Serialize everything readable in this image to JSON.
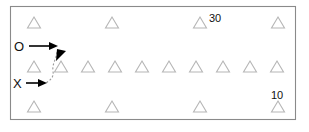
{
  "figure": {
    "background_color": "#ffffff",
    "frame": {
      "x": 10,
      "y": 6,
      "width": 286,
      "height": 114,
      "stroke_color": "#8a8a8a"
    },
    "marker": {
      "shape": "triangle-outline",
      "stroke_color": "#b6b6b6",
      "width": 13,
      "height": 11
    },
    "rows": [
      {
        "name": "top-row",
        "y": 28,
        "x_positions": [
          34,
          112,
          200,
          278
        ]
      },
      {
        "name": "middle-row",
        "y": 72,
        "x_positions": [
          34,
          61,
          88,
          115,
          142,
          169,
          196,
          223,
          250,
          277
        ]
      },
      {
        "name": "bottom-row",
        "y": 112,
        "x_positions": [
          34,
          112,
          200,
          278
        ]
      }
    ],
    "value_labels": [
      {
        "name": "label-30",
        "text": "30",
        "x": 205,
        "y": 21
      },
      {
        "name": "label-10",
        "text": "10",
        "x": 272,
        "y": 98
      }
    ],
    "annotations": [
      {
        "name": "o-annotation",
        "label": "O",
        "label_x": 14,
        "label_y": 51,
        "arrow_start_x": 29,
        "arrow_start_y": 46,
        "arrow_end_x": 57,
        "arrow_end_y": 46
      },
      {
        "name": "x-annotation",
        "label": "X",
        "label_x": 14,
        "label_y": 88,
        "arrow_start_x": 27,
        "arrow_start_y": 83,
        "arrow_end_x": 46,
        "arrow_end_y": 83
      }
    ],
    "pointer_arrowhead": {
      "name": "down-pointer-arrowhead",
      "x": 58,
      "y": 53
    },
    "dashed_curve": {
      "name": "dashed-connector-curve",
      "description": "dashed curve linking the O pointer down past the second middle marker to the X arrow"
    }
  }
}
